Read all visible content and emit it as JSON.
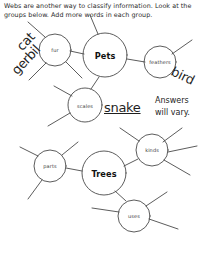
{
  "page": {
    "instructions": "Webs are another way to classify information. Look at the groups below. Add more words in each group.",
    "note": "Answers\nwill vary.",
    "ink_color": "#1a1a1a",
    "paper_color": "#ffffff"
  },
  "webs": [
    {
      "id": "pets-web",
      "center": {
        "label": "Pets",
        "cx": 105,
        "cy": 55,
        "r": 22
      },
      "nodes": [
        {
          "label": "fur",
          "cx": 55,
          "cy": 50,
          "r": 16
        },
        {
          "label": "feathers",
          "cx": 160,
          "cy": 62,
          "r": 16
        },
        {
          "label": "scales",
          "cx": 85,
          "cy": 105,
          "r": 17
        }
      ],
      "student_words": [
        {
          "text": "cat",
          "near": "fur"
        },
        {
          "text": "gerbil",
          "near": "fur"
        },
        {
          "text": "bird",
          "near": "feathers"
        },
        {
          "text": "snake",
          "near": "scales"
        }
      ]
    },
    {
      "id": "trees-web",
      "center": {
        "label": "Trees",
        "cx": 104,
        "cy": 173,
        "r": 22
      },
      "nodes": [
        {
          "label": "parts",
          "cx": 50,
          "cy": 166,
          "r": 16
        },
        {
          "label": "kinds",
          "cx": 152,
          "cy": 150,
          "r": 16
        },
        {
          "label": "uses",
          "cx": 134,
          "cy": 216,
          "r": 16
        }
      ],
      "student_words": []
    }
  ]
}
